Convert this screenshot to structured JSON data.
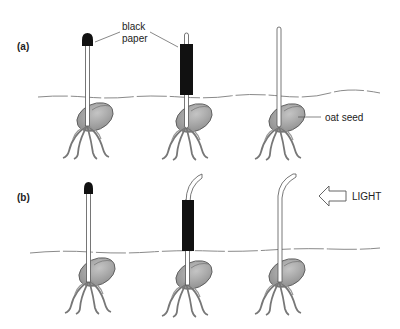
{
  "panels": [
    {
      "label": "(a)"
    },
    {
      "label": "(b)"
    }
  ],
  "annotations": {
    "black_paper_line1": "black",
    "black_paper_line2": "paper",
    "oat_seed": "oat seed",
    "light": "LIGHT"
  },
  "icons": {
    "light_arrow": "left-arrow-outline-icon"
  },
  "colors": {
    "soil_line": "#8a8a8a",
    "seed_fill": "#9a9a9a",
    "paper": "#111111",
    "stem_outline": "#555555"
  }
}
